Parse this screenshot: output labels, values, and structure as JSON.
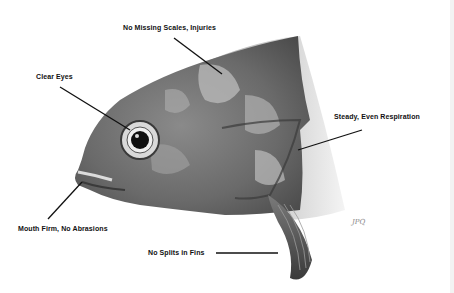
{
  "diagram": {
    "labels": {
      "scales": "No Missing Scales, Injuries",
      "eyes": "Clear Eyes",
      "respiration": "Steady, Even Respiration",
      "mouth": "Mouth Firm, No Abrasions",
      "fins": "No Splits in Fins"
    },
    "signature": "JPQ"
  }
}
